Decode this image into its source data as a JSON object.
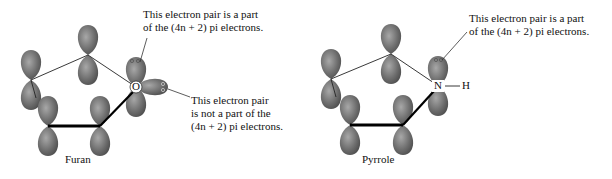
{
  "diagram": {
    "furan": {
      "name": "Furan",
      "heteroatom": "O",
      "annotation_top": [
        "This electron pair is a part",
        "of the (4n + 2) pi electrons."
      ],
      "annotation_right": [
        "This electron pair",
        "is not a part of the",
        "(4n + 2) pi electrons."
      ]
    },
    "pyrrole": {
      "name": "Pyrrole",
      "heteroatom": "N",
      "substituent": "H",
      "annotation_top": [
        "This electron pair is a part",
        "of the (4n + 2) pi electrons."
      ]
    },
    "colors": {
      "orbital_fill": "#6e6e6e",
      "orbital_highlight": "#9a9a9a",
      "bond": "#111111",
      "text": "#111111"
    }
  }
}
